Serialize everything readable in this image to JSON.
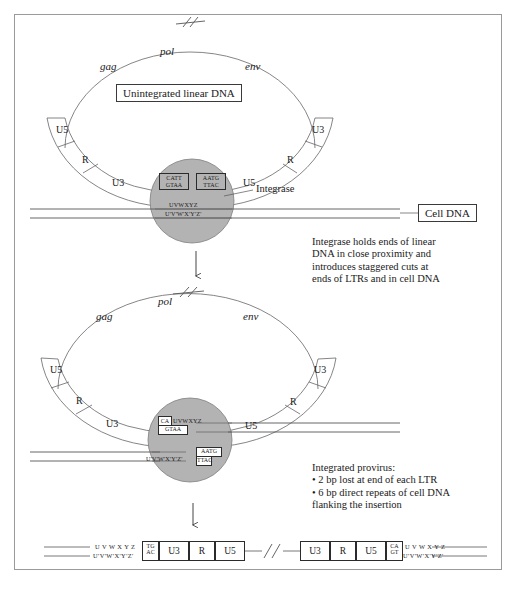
{
  "figure": {
    "colors": {
      "integrase_fill": "#b3b3b3",
      "integrase_stroke": "#6e6e6e",
      "line": "#555555",
      "border": "#9a9a9a",
      "text": "#1a1a1a"
    }
  },
  "panel_top": {
    "genes": {
      "gag": "gag",
      "pol": "pol",
      "env": "env"
    },
    "break_mark": "//",
    "center_box": "Unintegrated linear DNA",
    "left_ltr": [
      "U5",
      "R",
      "U3"
    ],
    "right_ltr": [
      "U3",
      "R",
      "U5"
    ],
    "integrase_label": "Integrase",
    "cell_dna_box": "Cell DNA",
    "left_end": {
      "top": "CATT",
      "bottom": "GTAA"
    },
    "right_end": {
      "top": "AATG",
      "bottom": "TTAC"
    },
    "cell_top": "UVWXYZ",
    "cell_bottom": "U'V'W'X'Y'Z'"
  },
  "caption_top": "Integrase holds ends of linear\nDNA in close proximity and\nintroduces staggered cuts at\nends of LTRs and in cell DNA",
  "panel_bottom": {
    "genes": {
      "gag": "gag",
      "pol": "pol",
      "env": "env"
    },
    "break_mark": "//",
    "left_ltr": [
      "U5",
      "R",
      "U3"
    ],
    "right_ltr": [
      "U3",
      "R",
      "U5"
    ],
    "left_join": {
      "prefix": "CA",
      "cell": "UVWXYZ",
      "bottom": "GTAA"
    },
    "right_join": {
      "cell": "U'V'W'X'Y'Z'",
      "top": "AATG",
      "bottom": "TTAC"
    }
  },
  "caption_bottom": "Integrated provirus:\n• 2 bp lost at end of each LTR\n• 6 bp direct repeats of cell DNA\nflanking the insertion",
  "strip": {
    "left_cell": {
      "top": "U V W X Y Z",
      "bottom": "U'V'W'X'Y'Z'"
    },
    "left_dinuc": {
      "top": "TG",
      "bottom": "AC"
    },
    "left_segments": [
      "U3",
      "R",
      "U5"
    ],
    "break_mark": "//",
    "right_segments": [
      "U3",
      "R",
      "U5"
    ],
    "right_dinuc": {
      "top": "CA",
      "bottom": "GT"
    },
    "right_cell": {
      "top": "U V W X Y Z",
      "bottom": "U'V'W'X'Y'Z'"
    }
  },
  "arrows": {
    "count": 2,
    "glyph": "↓"
  }
}
